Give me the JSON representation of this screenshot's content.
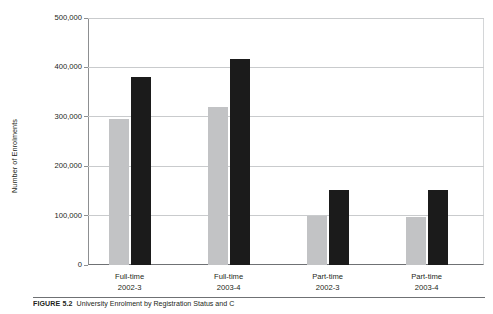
{
  "chart_data": {
    "type": "bar",
    "title": "",
    "xlabel": "",
    "ylabel": "Number of Enrolments",
    "ylim": [
      0,
      500000
    ],
    "ytick_step": 100000,
    "yticks": [
      "0",
      "100,000",
      "200,000",
      "300,000",
      "400,000",
      "500,000"
    ],
    "ytick_values": [
      0,
      100000,
      200000,
      300000,
      400000,
      500000
    ],
    "grid": true,
    "legend": "none",
    "categories": [
      "Full-time\n2002-3",
      "Full-time\n2003-4",
      "Part-time\n2002-3",
      "Part-time\n2003-4"
    ],
    "category_lines": [
      [
        "Full-time",
        "2002-3"
      ],
      [
        "Full-time",
        "2003-4"
      ],
      [
        "Part-time",
        "2002-3"
      ],
      [
        "Part-time",
        "2003-4"
      ]
    ],
    "series": [
      {
        "name": "series-1",
        "color": "#c2c3c5",
        "values": [
          295000,
          320000,
          100000,
          97000
        ]
      },
      {
        "name": "series-2",
        "color": "#1b1b1b",
        "values": [
          380000,
          418000,
          152000,
          152000
        ]
      }
    ]
  },
  "caption": {
    "figure_number": "FIGURE 5.2",
    "figure_title": "University Enrolment by Registration Status and C"
  },
  "colors": {
    "bar_light": "#c2c3c5",
    "bar_dark": "#1b1b1b",
    "gridline": "#c9cbcd",
    "axis": "#6f7174",
    "text": "#231f20"
  }
}
